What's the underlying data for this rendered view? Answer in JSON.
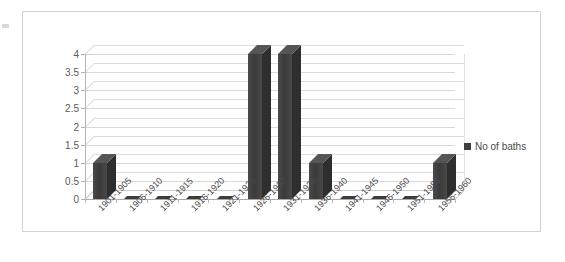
{
  "chart_data": {
    "type": "bar",
    "title": "",
    "xlabel": "",
    "ylabel": "",
    "grid": true,
    "legend_position": "right",
    "ylim": [
      0,
      4
    ],
    "ytick_step": 0.5,
    "yticks": [
      "0",
      "0.5",
      "1",
      "1.5",
      "2",
      "2.5",
      "3",
      "3.5",
      "4"
    ],
    "categories": [
      "1901-1905",
      "1906-1910",
      "1911-1915",
      "1916-1920",
      "1921-1925",
      "1926-1930",
      "1931-1935",
      "1936-1940",
      "1941-1945",
      "1946-1950",
      "1951-1955",
      "1956-1960"
    ],
    "series": [
      {
        "name": "No of baths",
        "color": "#3f3f3f",
        "values": [
          1,
          0,
          0,
          0,
          0,
          4,
          4,
          1,
          0,
          0,
          0,
          1
        ]
      }
    ]
  },
  "legend": {
    "entries": [
      {
        "label": "No of baths",
        "marker": "square-marker",
        "color": "#3f3f3f"
      }
    ]
  }
}
